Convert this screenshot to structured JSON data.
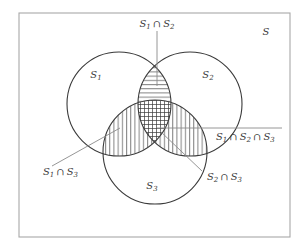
{
  "figure": {
    "type": "venn-diagram",
    "set_count": 3,
    "universal_set_label": "S",
    "stroke_color": "#3a3a3a",
    "rect_border_color": "#a8a8a8",
    "background_color": "#ffffff",
    "hatch_color": "#3a3a3a",
    "leader_line_color": "#8a8a8a"
  },
  "universe": {
    "label": "S",
    "rect": {
      "x": 19,
      "y": 13,
      "width": 271,
      "height": 224
    }
  },
  "circles": [
    {
      "id": "S1",
      "label": "S",
      "subscript": "1",
      "cx": 119,
      "cy": 104,
      "r": 52,
      "label_x": 96,
      "label_y": 75
    },
    {
      "id": "S2",
      "label": "S",
      "subscript": "2",
      "cx": 190,
      "cy": 104,
      "r": 52,
      "label_x": 208,
      "label_y": 75
    },
    {
      "id": "S3",
      "label": "S",
      "subscript": "3",
      "cx": 155,
      "cy": 152,
      "r": 52,
      "label_x": 152,
      "label_y": 186
    }
  ],
  "regions": [
    {
      "id": "S1-inter-S2",
      "name": "s1-s2-lens",
      "hatch": "horizontal",
      "description": "top lens where circle S1 and circle S2 overlap"
    },
    {
      "id": "S1-inter-S3",
      "name": "s1-s3-lens",
      "hatch": "vertical",
      "description": "lower-left lens where circle S1 and circle S3 overlap"
    },
    {
      "id": "S2-inter-S3",
      "name": "s2-s3-lens",
      "hatch": "vertical",
      "description": "lower-right lens where circle S2 and circle S3 overlap"
    },
    {
      "id": "S1-inter-S2-inter-S3",
      "name": "triple-intersection",
      "hatch": "cross",
      "description": "central region common to all three circles"
    }
  ],
  "annotations": [
    {
      "id": "label-s1-s2",
      "name": "s1-inter-s2-label",
      "parts": [
        {
          "base": "S",
          "sub": "1"
        },
        {
          "op": "∩"
        },
        {
          "base": "S",
          "sub": "2"
        }
      ],
      "text": "S1 ∩ S2",
      "text_x": 157,
      "text_y": 24,
      "anchor": "middle",
      "leader": {
        "x1": 157,
        "y1": 31,
        "x2": 157,
        "y2": 86
      }
    },
    {
      "id": "label-s1-s2-s3",
      "name": "s1-inter-s2-inter-s3-label",
      "parts": [
        {
          "base": "S",
          "sub": "1"
        },
        {
          "op": "∩"
        },
        {
          "base": "S",
          "sub": "2"
        },
        {
          "op": "∩"
        },
        {
          "base": "S",
          "sub": "3"
        }
      ],
      "text": "S1 ∩ S2 ∩ S3",
      "text_x": 216,
      "text_y": 137,
      "anchor": "start",
      "leader": {
        "x1": 282,
        "y1": 128,
        "x2": 157,
        "y2": 128
      }
    },
    {
      "id": "label-s1-s3",
      "name": "s1-inter-s3-label",
      "parts": [
        {
          "base": "S",
          "sub": "1"
        },
        {
          "op": "∩"
        },
        {
          "base": "S",
          "sub": "3"
        }
      ],
      "text": "S1 ∩ S3",
      "text_x": 43,
      "text_y": 172,
      "anchor": "start",
      "leader": {
        "x1": 52,
        "y1": 166,
        "x2": 120,
        "y2": 128
      }
    },
    {
      "id": "label-s2-s3",
      "name": "s2-inter-s3-label",
      "parts": [
        {
          "base": "S",
          "sub": "2"
        },
        {
          "op": "∩"
        },
        {
          "base": "S",
          "sub": "3"
        }
      ],
      "text": "S2 ∩ S3",
      "text_x": 207,
      "text_y": 177,
      "anchor": "start",
      "leader": {
        "x1": 202,
        "y1": 171,
        "x2": 160,
        "y2": 131
      }
    }
  ],
  "universe_label_pos": {
    "x": 266,
    "y": 32
  }
}
